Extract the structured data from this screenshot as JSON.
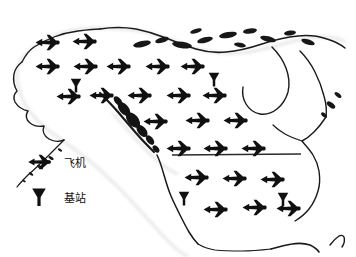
{
  "figure": {
    "type": "map",
    "top_caption_faded": "· · · ·        · · · ·",
    "region_label": "North America"
  },
  "legend": {
    "name": "map-legend",
    "items": [
      {
        "glyph": "airplane-icon",
        "label": "飞机"
      },
      {
        "glyph": "base-station-icon",
        "label": "基站"
      }
    ]
  },
  "colors": {
    "ink": "#101010",
    "coastline": "#1a1a1a",
    "border_line": "#2b2b2b",
    "background": "#ffffff",
    "halo": "#cfcfcf"
  },
  "map_features": {
    "border_line": {
      "name": "usa-canada-border-line",
      "x1": 172,
      "y1": 146,
      "x2": 301,
      "y2": 145
    }
  },
  "aircraft": [
    {
      "x": 47,
      "y": 33
    },
    {
      "x": 84,
      "y": 32
    },
    {
      "x": 47,
      "y": 57
    },
    {
      "x": 85,
      "y": 57
    },
    {
      "x": 118,
      "y": 57
    },
    {
      "x": 157,
      "y": 57
    },
    {
      "x": 192,
      "y": 57
    },
    {
      "x": 68,
      "y": 87
    },
    {
      "x": 101,
      "y": 86
    },
    {
      "x": 139,
      "y": 86
    },
    {
      "x": 178,
      "y": 86
    },
    {
      "x": 214,
      "y": 86
    },
    {
      "x": 155,
      "y": 112
    },
    {
      "x": 197,
      "y": 111
    },
    {
      "x": 235,
      "y": 111
    },
    {
      "x": 178,
      "y": 139
    },
    {
      "x": 215,
      "y": 139
    },
    {
      "x": 253,
      "y": 139
    },
    {
      "x": 196,
      "y": 168
    },
    {
      "x": 234,
      "y": 169
    },
    {
      "x": 272,
      "y": 170
    },
    {
      "x": 215,
      "y": 200
    },
    {
      "x": 254,
      "y": 198
    },
    {
      "x": 288,
      "y": 199
    }
  ],
  "base_stations": [
    {
      "x": 76,
      "y": 76
    },
    {
      "x": 214,
      "y": 70
    },
    {
      "x": 184,
      "y": 189
    },
    {
      "x": 283,
      "y": 190
    }
  ]
}
